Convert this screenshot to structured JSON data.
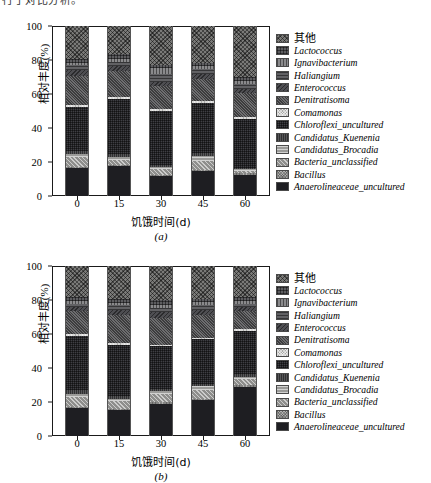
{
  "top_cutoff_text": "行了对比分析。",
  "legend": {
    "items": [
      {
        "label": "其他",
        "cjk": true,
        "color": "#7a7a78",
        "pattern": "diag-cross"
      },
      {
        "label": "Lactococcus",
        "cjk": false,
        "color": "#5d5d60",
        "pattern": "grid"
      },
      {
        "label": "Ignavibacterium",
        "cjk": false,
        "color": "#8a8a8c",
        "pattern": "vertical"
      },
      {
        "label": "Haliangium",
        "cjk": false,
        "color": "#616164",
        "pattern": "horizontal"
      },
      {
        "label": "Enterococcus",
        "cjk": false,
        "color": "#4e4e52",
        "pattern": "diag-back"
      },
      {
        "label": "Denitratisoma",
        "cjk": false,
        "color": "#6e6e70",
        "pattern": "dots"
      },
      {
        "label": "Comamonas",
        "cjk": false,
        "color": "#a9a9a7",
        "pattern": "dots-fine"
      },
      {
        "label": "Chloroflexi_uncultured",
        "cjk": false,
        "color": "#3f3f44",
        "pattern": "grid-dense"
      },
      {
        "label": "Candidatus_Kuenenia",
        "cjk": false,
        "color": "#575759",
        "pattern": "vertical-dense"
      },
      {
        "label": "Candidatus_Brocadia",
        "cjk": false,
        "color": "#9b9b99",
        "pattern": "horizontal-wide"
      },
      {
        "label": "Bacteria_unclassified",
        "cjk": false,
        "color": "#8e8e8c",
        "pattern": "diag-fwd"
      },
      {
        "label": "Bacillus",
        "cjk": false,
        "color": "#b2b2b0",
        "pattern": "speckle"
      },
      {
        "label": "Anaerolineaceae_uncultured",
        "cjk": false,
        "color": "#1e1e22",
        "pattern": "solid"
      }
    ]
  },
  "chart_data": [
    {
      "id": "a",
      "type": "bar",
      "subfigure_label": "(a)",
      "title": "",
      "xlabel": "饥饿时间(d)",
      "ylabel": "相对丰度(%)",
      "categories": [
        "0",
        "15",
        "30",
        "45",
        "60"
      ],
      "ylim": [
        0,
        100
      ],
      "yticks": [
        0,
        20,
        40,
        60,
        80,
        100
      ],
      "grid": false,
      "stacked": true,
      "legend_position": "right",
      "series": [
        {
          "name": "Anaerolineaceae_uncultured",
          "values": [
            16.5,
            17.5,
            11.5,
            14.5,
            12.5
          ]
        },
        {
          "name": "Bacillus",
          "values": [
            0.8,
            0.8,
            0.7,
            0.7,
            0.7
          ]
        },
        {
          "name": "Bacteria_unclassified",
          "values": [
            5.5,
            3.0,
            3.5,
            5.5,
            1.5
          ]
        },
        {
          "name": "Candidatus_Brocadia",
          "values": [
            2.0,
            1.5,
            1.5,
            2.5,
            1.0
          ]
        },
        {
          "name": "Candidatus_Kuenenia",
          "values": [
            1.5,
            2.0,
            1.0,
            2.0,
            1.0
          ]
        },
        {
          "name": "Chloroflexi_uncultured",
          "values": [
            26.0,
            32.5,
            31.5,
            29.5,
            28.5
          ]
        },
        {
          "name": "Comamonas",
          "values": [
            1.0,
            1.0,
            1.5,
            1.0,
            1.0
          ]
        },
        {
          "name": "Denitratisoma",
          "values": [
            17.5,
            15.0,
            13.5,
            13.0,
            14.5
          ]
        },
        {
          "name": "Enterococcus",
          "values": [
            3.5,
            3.0,
            2.5,
            3.0,
            2.5
          ]
        },
        {
          "name": "Haliangium",
          "values": [
            3.0,
            2.5,
            4.5,
            3.0,
            2.5
          ]
        },
        {
          "name": "Ignavibacterium",
          "values": [
            1.0,
            2.0,
            3.5,
            1.5,
            2.0
          ]
        },
        {
          "name": "Lactococcus",
          "values": [
            2.0,
            2.5,
            2.0,
            2.0,
            2.5
          ]
        },
        {
          "name": "其他",
          "values": [
            19.7,
            16.7,
            22.8,
            21.8,
            29.8
          ]
        }
      ]
    },
    {
      "id": "b",
      "type": "bar",
      "subfigure_label": "(b)",
      "title": "",
      "xlabel": "饥饿时间(d)",
      "ylabel": "相对丰度(%)",
      "categories": [
        "0",
        "15",
        "30",
        "45",
        "60"
      ],
      "ylim": [
        0,
        100
      ],
      "yticks": [
        0,
        20,
        40,
        60,
        80,
        100
      ],
      "grid": false,
      "stacked": true,
      "legend_position": "right",
      "series": [
        {
          "name": "Anaerolineaceae_uncultured",
          "values": [
            16.5,
            15.0,
            19.0,
            21.0,
            29.0
          ]
        },
        {
          "name": "Bacillus",
          "values": [
            0.8,
            0.8,
            0.8,
            0.8,
            0.8
          ]
        },
        {
          "name": "Bacteria_unclassified",
          "values": [
            5.5,
            4.5,
            5.0,
            5.5,
            3.5
          ]
        },
        {
          "name": "Candidatus_Brocadia",
          "values": [
            2.0,
            1.5,
            1.5,
            2.0,
            1.5
          ]
        },
        {
          "name": "Candidatus_Kuenenia",
          "values": [
            2.0,
            1.5,
            1.5,
            1.5,
            1.5
          ]
        },
        {
          "name": "Chloroflexi_uncultured",
          "values": [
            32.0,
            30.5,
            25.0,
            26.0,
            25.5
          ]
        },
        {
          "name": "Comamonas",
          "values": [
            1.0,
            1.0,
            1.0,
            1.0,
            1.0
          ]
        },
        {
          "name": "Denitratisoma",
          "values": [
            13.5,
            16.5,
            15.5,
            13.5,
            10.5
          ]
        },
        {
          "name": "Enterococcus",
          "values": [
            2.5,
            3.0,
            3.5,
            3.0,
            2.5
          ]
        },
        {
          "name": "Haliangium",
          "values": [
            2.0,
            2.5,
            2.5,
            2.5,
            2.0
          ]
        },
        {
          "name": "Ignavibacterium",
          "values": [
            1.5,
            1.5,
            2.0,
            2.0,
            1.5
          ]
        },
        {
          "name": "Lactococcus",
          "values": [
            2.5,
            2.5,
            2.5,
            2.0,
            2.5
          ]
        },
        {
          "name": "其他",
          "values": [
            18.2,
            19.2,
            20.2,
            19.2,
            18.2
          ]
        }
      ]
    }
  ]
}
